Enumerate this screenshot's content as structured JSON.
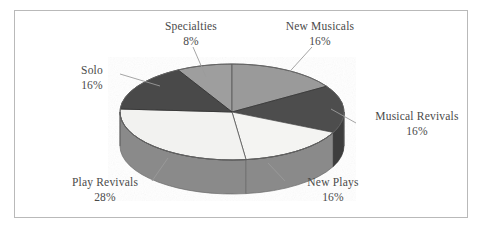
{
  "figure": {
    "border_color": "#b9b9b9",
    "background": "#ffffff"
  },
  "chart_data": {
    "type": "pie",
    "title": "",
    "subtitle": "",
    "xlabel": "",
    "ylabel": "",
    "legend_position": "none",
    "grid": false,
    "three_d": true,
    "labels_show_name_and_percent": true,
    "categories": [
      "New Musicals",
      "Musical Revivals",
      "New Plays",
      "Play Revivals",
      "Solo",
      "Specialties"
    ],
    "values": [
      16,
      16,
      16,
      28,
      16,
      8
    ],
    "percent_labels": [
      "16%",
      "16%",
      "16%",
      "28%",
      "16%",
      "8%"
    ],
    "slices": [
      {
        "name": "New Musicals",
        "value": 16,
        "percent_label": "16%",
        "top_color": "#9a9a9a",
        "side_color": "#7d7d7d",
        "start_deg": 0,
        "end_deg": 57.6
      },
      {
        "name": "Musical Revivals",
        "value": 16,
        "percent_label": "16%",
        "top_color": "#4e4e4e",
        "side_color": "#3d3d3d",
        "start_deg": 57.6,
        "end_deg": 115.2
      },
      {
        "name": "New Plays",
        "value": 16,
        "percent_label": "16%",
        "top_color": "#f4f4f2",
        "side_color": "#8a8a8a",
        "start_deg": 115.2,
        "end_deg": 172.8
      },
      {
        "name": "Play Revivals",
        "value": 28,
        "percent_label": "28%",
        "top_color": "#f2f2f0",
        "side_color": "#8a8a8a",
        "start_deg": 172.8,
        "end_deg": 273.6
      },
      {
        "name": "Solo",
        "value": 16,
        "percent_label": "16%",
        "top_color": "#4a4a4a",
        "side_color": "#3a3a3a",
        "start_deg": 273.6,
        "end_deg": 331.2
      },
      {
        "name": "Specialties",
        "value": 8,
        "percent_label": "8%",
        "top_color": "#9e9e9e",
        "side_color": "#808080",
        "start_deg": 331.2,
        "end_deg": 360
      }
    ]
  },
  "labels": {
    "specialties": {
      "name": "Specialties",
      "pct": "8%"
    },
    "new_musicals": {
      "name": "New Musicals",
      "pct": "16%"
    },
    "solo": {
      "name": "Solo",
      "pct": "16%"
    },
    "musical_revivals": {
      "name": "Musical Revivals",
      "pct": "16%"
    },
    "play_revivals": {
      "name": "Play Revivals",
      "pct": "28%"
    },
    "new_plays": {
      "name": "New Plays",
      "pct": "16%"
    }
  }
}
